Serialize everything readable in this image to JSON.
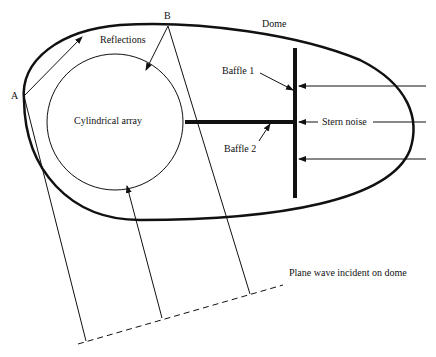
{
  "diagram": {
    "labels": {
      "point_a": "A",
      "point_b": "B",
      "dome": "Dome",
      "reflections": "Reflections",
      "cylindrical_array": "Cylindrical array",
      "baffle_1": "Baffle 1",
      "baffle_2": "Baffle 2",
      "stern_noise": "Stern noise",
      "plane_wave": "Plane wave incident on dome"
    },
    "colors": {
      "stroke": "#111111",
      "background": "#ffffff"
    }
  }
}
